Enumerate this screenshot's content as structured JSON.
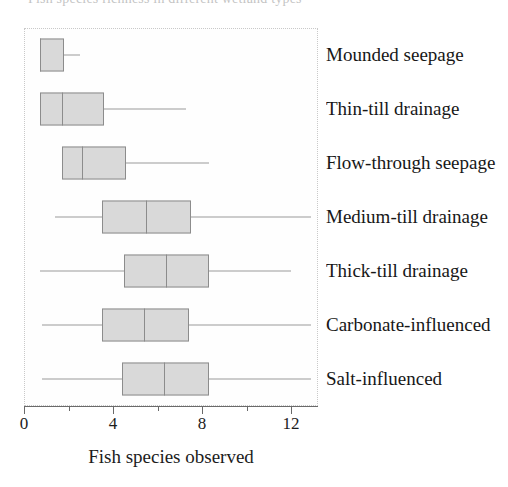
{
  "chart_data": {
    "type": "box",
    "title": "Fish species richness in different wetland types",
    "xlabel": "Fish species observed",
    "ylabel": "",
    "xlim": [
      0,
      13.2
    ],
    "grid": false,
    "legend": "none",
    "orientation": "horizontal",
    "xticks": [
      0,
      2,
      4,
      6,
      8,
      10,
      12
    ],
    "xticklabels_major": [
      "0",
      "4",
      "8",
      "12"
    ],
    "xtickvalues_major": [
      0,
      4,
      8,
      12
    ],
    "xtickvalues_minor": [
      2,
      6,
      10
    ],
    "categories": [
      "Mounded seepage",
      "Thin-till drainage",
      "Flow-through seepage",
      "Medium-till drainage",
      "Thick-till drainage",
      "Carbonate-influenced",
      "Salt-influenced"
    ],
    "boxes": [
      {
        "label": "Mounded seepage",
        "whisker_low": 0.7,
        "q1": 0.7,
        "median": 0.7,
        "q3": 1.8,
        "whisker_high": 2.5
      },
      {
        "label": "Thin-till drainage",
        "whisker_low": 0.7,
        "q1": 0.7,
        "median": 1.7,
        "q3": 3.6,
        "whisker_high": 7.3
      },
      {
        "label": "Flow-through seepage",
        "whisker_low": 1.7,
        "q1": 1.7,
        "median": 2.6,
        "q3": 4.6,
        "whisker_high": 8.3
      },
      {
        "label": "Medium-till drainage",
        "whisker_low": 1.4,
        "q1": 3.5,
        "median": 5.5,
        "q3": 7.5,
        "whisker_high": 12.9
      },
      {
        "label": "Thick-till drainage",
        "whisker_low": 0.7,
        "q1": 4.5,
        "median": 6.4,
        "q3": 8.3,
        "whisker_high": 12.0
      },
      {
        "label": "Carbonate-influenced",
        "whisker_low": 0.8,
        "q1": 3.5,
        "median": 5.4,
        "q3": 7.4,
        "whisker_high": 12.9
      },
      {
        "label": "Salt-influenced",
        "whisker_low": 0.8,
        "q1": 4.4,
        "median": 6.3,
        "q3": 8.3,
        "whisker_high": 12.9
      }
    ],
    "colors": {
      "box_fill": "#d9d9d9",
      "box_edge": "#8c8c8c",
      "whisker": "#9a9a9a",
      "axis": "#6a6a6a",
      "text": "#1c1c1c",
      "frame": "#c9c9c9"
    }
  }
}
